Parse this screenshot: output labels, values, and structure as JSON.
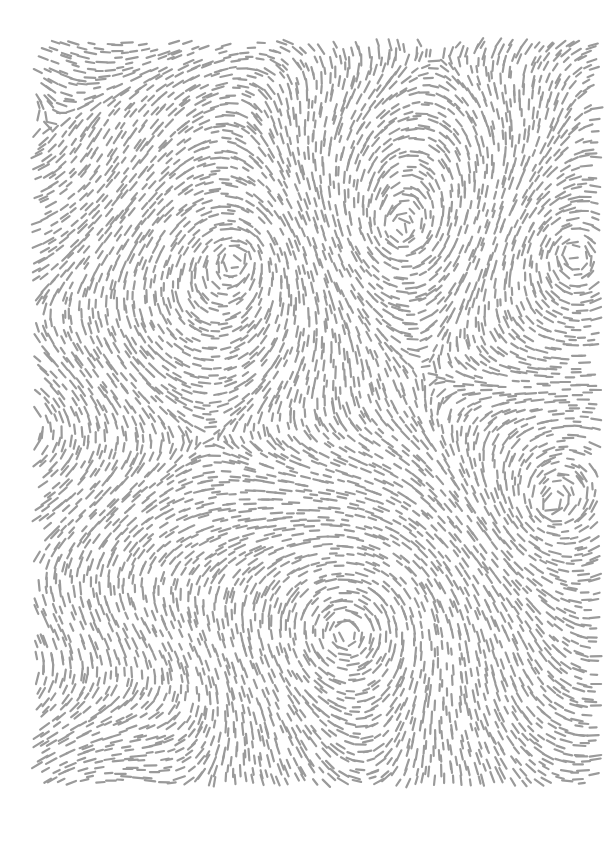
{
  "canvas": {
    "width": 612,
    "height": 841,
    "background": "#ffffff"
  },
  "pattern": {
    "type": "flow-field-dashes",
    "bounds": {
      "x0": 36,
      "y0": 42,
      "x1": 597,
      "y1": 788
    },
    "stroke_color": "#9a9a9a",
    "stroke_width": 2.2,
    "dash_length": 10,
    "spacing": 9,
    "vortices": [
      {
        "x": 240,
        "y": 255,
        "strength": 1.0,
        "radius": 140
      },
      {
        "x": 400,
        "y": 232,
        "strength": -1.0,
        "radius": 130
      },
      {
        "x": 572,
        "y": 252,
        "strength": 1.0,
        "radius": 110
      },
      {
        "x": 550,
        "y": 508,
        "strength": -1.0,
        "radius": 120
      },
      {
        "x": 345,
        "y": 635,
        "strength": 1.0,
        "radius": 140
      }
    ],
    "base_flow": {
      "angle_deg": 0,
      "wave_amp": 0.6,
      "wave_freq": 0.012
    }
  }
}
